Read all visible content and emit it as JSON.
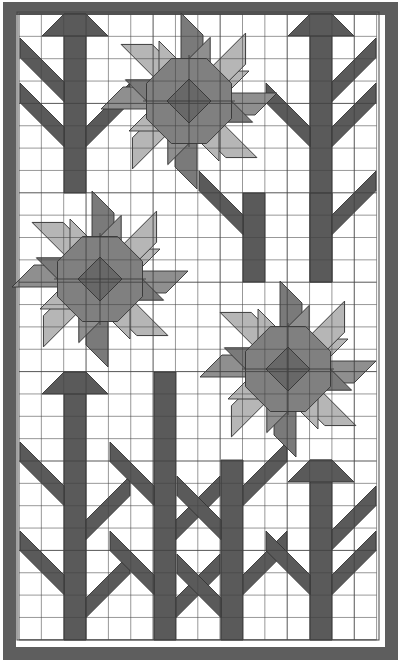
{
  "diagram": {
    "type": "quilt_pattern",
    "canvas": {
      "width": 401,
      "height": 661
    },
    "colors": {
      "background": "#ffffff",
      "border": "#5e5e5e",
      "stem": "#5a5a5a",
      "petal_dark": "#7a7a7a",
      "petal_mid": "#8f8f8f",
      "petal_light": "#b6b6b6",
      "center_octagon": "#808080",
      "center_diamond": "#686868",
      "grid_line": "#444444"
    },
    "border": {
      "outer": [
        3,
        2,
        395,
        658
      ],
      "inner_frame": [
        17,
        12,
        362,
        628
      ],
      "width": 13
    },
    "grid": {
      "x0": 19,
      "y0": 14,
      "cols": 16,
      "rows": 28,
      "cell": 22.35
    },
    "flowers": [
      {
        "id": "flower-top-center",
        "cx": 189,
        "cy": 101
      },
      {
        "id": "flower-middle-left",
        "cx": 100,
        "cy": 279
      },
      {
        "id": "flower-middle-right",
        "cx": 288,
        "cy": 369
      }
    ],
    "stems": [
      {
        "id": "stem-top-left",
        "x": 64,
        "y1": 14,
        "y2": 193,
        "w": 22,
        "top": "arrow"
      },
      {
        "id": "stem-top-right",
        "x": 310,
        "y1": 14,
        "y2": 282,
        "w": 22,
        "top": "arrow"
      },
      {
        "id": "stem-mid-center-a",
        "x": 243,
        "y1": 193,
        "y2": 282,
        "w": 22,
        "top": "flat"
      },
      {
        "id": "stem-mid-center-b",
        "x": 310,
        "y1": 193,
        "y2": 282,
        "w": 22,
        "top": "flat"
      },
      {
        "id": "stem-bottom-1",
        "x": 64,
        "y1": 372,
        "y2": 640,
        "w": 22,
        "top": "arrow"
      },
      {
        "id": "stem-bottom-2",
        "x": 154,
        "y1": 372,
        "y2": 640,
        "w": 22,
        "top": "flat"
      },
      {
        "id": "stem-bottom-3",
        "x": 221,
        "y1": 460,
        "y2": 640,
        "w": 22,
        "top": "flat"
      },
      {
        "id": "stem-bottom-4",
        "x": 310,
        "y1": 460,
        "y2": 640,
        "w": 22,
        "top": "arrow"
      }
    ],
    "leaves": [
      {
        "stem": "stem-top-left",
        "side": "left",
        "y": 82
      },
      {
        "stem": "stem-top-left",
        "side": "left",
        "y": 127
      },
      {
        "stem": "stem-top-left",
        "side": "right",
        "y": 127
      },
      {
        "stem": "stem-top-right",
        "side": "right",
        "y": 82
      },
      {
        "stem": "stem-top-right",
        "side": "left",
        "y": 127
      },
      {
        "stem": "stem-top-right",
        "side": "right",
        "y": 127
      },
      {
        "stem": "stem-mid-center-a",
        "side": "left",
        "y": 215
      },
      {
        "stem": "stem-mid-center-b",
        "side": "right",
        "y": 215
      },
      {
        "stem": "stem-bottom-1",
        "side": "left",
        "y": 486
      },
      {
        "stem": "stem-bottom-1",
        "side": "right",
        "y": 520
      },
      {
        "stem": "stem-bottom-1",
        "side": "left",
        "y": 575
      },
      {
        "stem": "stem-bottom-1",
        "side": "right",
        "y": 598
      },
      {
        "stem": "stem-bottom-2",
        "side": "left",
        "y": 486
      },
      {
        "stem": "stem-bottom-2",
        "side": "right",
        "y": 520
      },
      {
        "stem": "stem-bottom-2",
        "side": "left",
        "y": 575
      },
      {
        "stem": "stem-bottom-2",
        "side": "right",
        "y": 598
      },
      {
        "stem": "stem-bottom-3",
        "side": "right",
        "y": 486
      },
      {
        "stem": "stem-bottom-3",
        "side": "left",
        "y": 520
      },
      {
        "stem": "stem-bottom-3",
        "side": "right",
        "y": 575
      },
      {
        "stem": "stem-bottom-3",
        "side": "left",
        "y": 598
      },
      {
        "stem": "stem-bottom-4",
        "side": "right",
        "y": 530
      },
      {
        "stem": "stem-bottom-4",
        "side": "left",
        "y": 575
      },
      {
        "stem": "stem-bottom-4",
        "side": "right",
        "y": 575
      }
    ]
  }
}
